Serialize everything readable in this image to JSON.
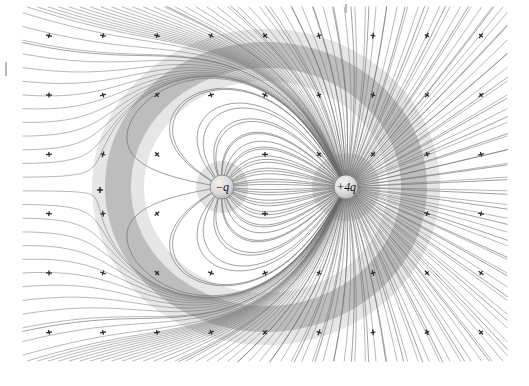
{
  "figure": {
    "type": "field-line-diagram",
    "background_color": "#ffffff",
    "width": 529,
    "height": 386,
    "line_color": "#6a6a6a",
    "shade_color": "#9a9a9a",
    "sphere_fill": "#d8d8d8",
    "sphere_stroke": "#7a7a7a"
  },
  "charges": [
    {
      "name": "negative-charge",
      "label": "−q",
      "sign": "negative",
      "magnitude": 1,
      "x": 222,
      "y": 187,
      "radius": 12
    },
    {
      "name": "positive-charge",
      "label": "+4q",
      "sign": "positive",
      "magnitude": 4,
      "x": 346,
      "y": 187,
      "radius": 12
    }
  ],
  "null_point": {
    "name": "saddle-point",
    "x": 100,
    "y": 190,
    "label": ""
  },
  "plot_region": {
    "left": 22,
    "top": 6,
    "right": 508,
    "bottom": 362
  },
  "field_lines": {
    "count_from_positive": 72,
    "count_from_negative": 18,
    "arrow_marker": "+",
    "arrow_marker_name": "direction-tick",
    "arrow_rows": 6,
    "arrow_columns": 9
  },
  "edge_marks": [
    {
      "name": "left-edge-tick",
      "x": 5,
      "y": 62,
      "width": 2,
      "height": 14
    },
    {
      "name": "top-edge-tick",
      "x": 345,
      "y": 4,
      "width": 2,
      "height": 9
    }
  ],
  "chart_data": {
    "type": "scatter",
    "xlabel": "",
    "ylabel": "",
    "xlim": [
      0,
      529
    ],
    "ylim": [
      0,
      386
    ],
    "grid": false,
    "legend": "none",
    "annotations": [
      "−q",
      "+4q"
    ],
    "series": [
      {
        "name": "negative-charge",
        "x": [
          222
        ],
        "y": [
          187
        ],
        "charge": -1
      },
      {
        "name": "positive-charge",
        "x": [
          346
        ],
        "y": [
          187
        ],
        "charge": 4
      },
      {
        "name": "saddle-point",
        "x": [
          100
        ],
        "y": [
          190
        ],
        "charge": 0
      }
    ]
  }
}
